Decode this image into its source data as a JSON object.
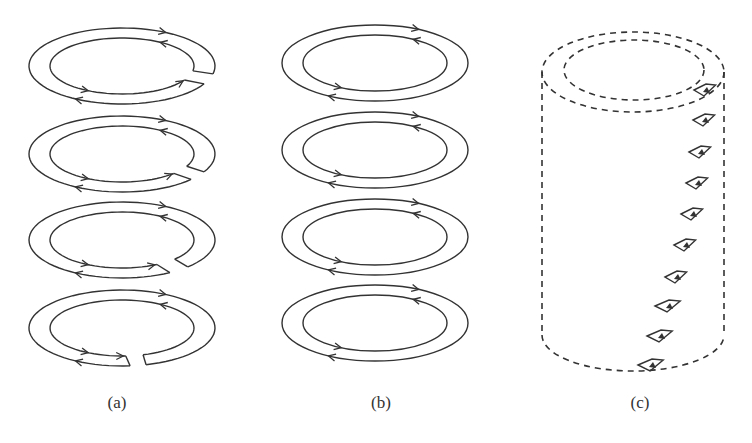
{
  "figure": {
    "panels": [
      {
        "id": "a",
        "label": "(a)",
        "description": "Four stacked ring pairs with arrows; each ring has a gap that widens downward",
        "rings": 4,
        "gaps": [
          true,
          true,
          true,
          true
        ]
      },
      {
        "id": "b",
        "label": "(b)",
        "description": "Four stacked closed ring pairs with opposing arrows",
        "rings": 4,
        "gaps": [
          false,
          false,
          false,
          false
        ]
      },
      {
        "id": "c",
        "label": "(c)",
        "description": "Dashed cylinder with small arrowed loops spiraling down the surface",
        "loops": 10
      }
    ]
  },
  "colors": {
    "stroke": "#333333",
    "background": "#ffffff"
  }
}
